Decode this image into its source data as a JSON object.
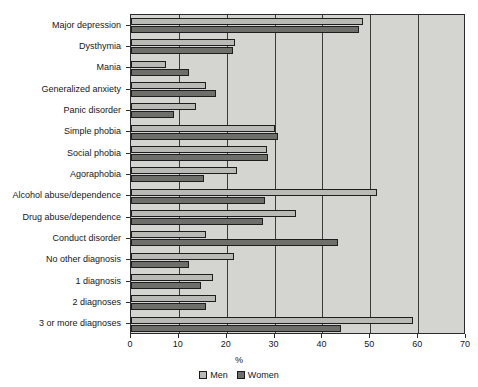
{
  "chart_data": {
    "type": "bar",
    "orientation": "horizontal",
    "title": "",
    "xlabel": "%",
    "ylabel": "",
    "xlim": [
      0,
      70
    ],
    "xticks": [
      0,
      10,
      20,
      30,
      40,
      50,
      60,
      70
    ],
    "xtick_labels": [
      "0",
      "10",
      "20",
      "30",
      "40",
      "50",
      "60",
      "70"
    ],
    "grid": true,
    "grid_axis": "x",
    "legend_position": "bottom",
    "categories": [
      "Major depression",
      "Dysthymia",
      "Mania",
      "Generalized anxiety",
      "Panic disorder",
      "Simple phobia",
      "Social phobia",
      "Agoraphobia",
      "Alcohol abuse/dependence",
      "Drug abuse/dependence",
      "Conduct disorder",
      "No other diagnosis",
      "1 diagnosis",
      "2 diagnoses",
      "3 or more diagnoses"
    ],
    "series": [
      {
        "name": "Men",
        "color": "#b9b9b6",
        "values": [
          48.5,
          21.7,
          7.3,
          15.7,
          13.6,
          30.1,
          28.4,
          22.1,
          51.4,
          34.4,
          15.7,
          21.5,
          17.1,
          17.7,
          58.9
        ]
      },
      {
        "name": "Women",
        "color": "#6e6e6b",
        "values": [
          47.6,
          21.3,
          12.1,
          17.8,
          9.0,
          30.7,
          28.6,
          15.2,
          28.0,
          27.6,
          43.2,
          12.1,
          14.6,
          15.7,
          43.8
        ]
      }
    ]
  },
  "legend": {
    "items": [
      {
        "label": "Men",
        "key": "men"
      },
      {
        "label": "Women",
        "key": "women"
      }
    ]
  }
}
